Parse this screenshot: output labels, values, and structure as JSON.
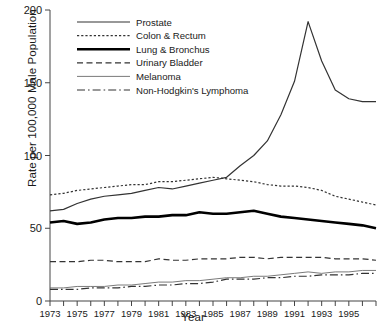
{
  "chart_data": {
    "type": "line",
    "title": "",
    "xlabel": "Year",
    "ylabel": "Rate per 100,000 Male Population",
    "xlim": [
      1973,
      1997
    ],
    "ylim": [
      0,
      200
    ],
    "yticks": [
      0,
      50,
      100,
      150,
      200
    ],
    "xticks": [
      1973,
      1975,
      1977,
      1979,
      1981,
      1983,
      1985,
      1987,
      1989,
      1991,
      1993,
      1995
    ],
    "xtick_all_years": [
      1973,
      1974,
      1975,
      1976,
      1977,
      1978,
      1979,
      1980,
      1981,
      1982,
      1983,
      1984,
      1985,
      1986,
      1987,
      1988,
      1989,
      1990,
      1991,
      1992,
      1993,
      1994,
      1995,
      1996,
      1997
    ],
    "grid": false,
    "legend_position": "upper-left-inside",
    "x": [
      1973,
      1974,
      1975,
      1976,
      1977,
      1978,
      1979,
      1980,
      1981,
      1982,
      1983,
      1984,
      1985,
      1986,
      1987,
      1988,
      1989,
      1990,
      1991,
      1992,
      1993,
      1994,
      1995,
      1996,
      1997
    ],
    "series": [
      {
        "name": "Prostate",
        "style": "solid",
        "width": 1.2,
        "color": "#333333",
        "values": [
          62,
          63,
          67,
          70,
          72,
          73,
          74,
          76,
          78,
          77,
          79,
          81,
          83,
          85,
          93,
          100,
          110,
          128,
          151,
          192,
          165,
          145,
          139,
          137,
          137
        ]
      },
      {
        "name": "Colon & Rectum",
        "style": "dotted",
        "width": 1.2,
        "color": "#333333",
        "values": [
          73,
          74,
          76,
          77,
          78,
          79,
          80,
          80,
          82,
          82,
          83,
          84,
          85,
          84,
          83,
          82,
          80,
          79,
          79,
          78,
          76,
          72,
          70,
          68,
          66
        ]
      },
      {
        "name": "Lung & Bronchus",
        "style": "solid",
        "width": 2.6,
        "color": "#000000",
        "values": [
          54,
          55,
          53,
          54,
          56,
          57,
          57,
          58,
          58,
          59,
          59,
          61,
          60,
          60,
          61,
          62,
          60,
          58,
          57,
          56,
          55,
          54,
          53,
          52,
          50
        ]
      },
      {
        "name": "Urinary Bladder",
        "style": "dashed",
        "width": 1.2,
        "color": "#333333",
        "values": [
          27,
          27,
          27,
          28,
          28,
          27,
          27,
          27,
          29,
          28,
          28,
          29,
          29,
          29,
          30,
          30,
          29,
          30,
          30,
          30,
          30,
          29,
          29,
          29,
          28
        ]
      },
      {
        "name": "Melanoma",
        "style": "solid",
        "width": 0.9,
        "color": "#6b6b6b",
        "values": [
          9,
          9,
          10,
          10,
          10,
          11,
          11,
          12,
          13,
          13,
          14,
          14,
          15,
          16,
          16,
          17,
          17,
          18,
          19,
          20,
          19,
          20,
          20,
          21,
          21
        ]
      },
      {
        "name": "Non-Hodgkin's Lymphoma",
        "style": "dashdot",
        "width": 1.2,
        "color": "#333333",
        "values": [
          8,
          8,
          8,
          9,
          9,
          9,
          10,
          10,
          11,
          11,
          12,
          12,
          13,
          15,
          15,
          15,
          16,
          16,
          17,
          17,
          18,
          18,
          18,
          19,
          19
        ]
      }
    ]
  }
}
